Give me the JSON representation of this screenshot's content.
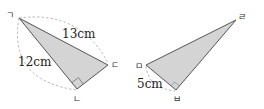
{
  "colors": {
    "fill": "#d4d4d4",
    "stroke": "#555555",
    "dash": "#999999",
    "text": "#222222"
  },
  "triangle_left": {
    "vertices": [
      {
        "name": "ㄱ",
        "x": 19,
        "y": 18
      },
      {
        "name": "ㄴ",
        "x": 77,
        "y": 89
      },
      {
        "name": "ㄷ",
        "x": 108,
        "y": 65
      }
    ],
    "right_angle_at": "ㄴ",
    "labels": {
      "hypotenuse": "13cm",
      "side": "12cm"
    }
  },
  "triangle_right": {
    "vertices": [
      {
        "name": "ㅁ",
        "x": 146,
        "y": 65
      },
      {
        "name": "ㅂ",
        "x": 176,
        "y": 90
      },
      {
        "name": "ㄹ",
        "x": 236,
        "y": 20
      }
    ],
    "right_angle_at": "ㅂ",
    "labels": {
      "side": "5cm"
    }
  }
}
